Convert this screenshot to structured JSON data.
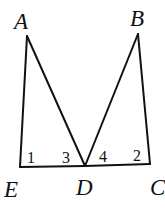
{
  "diagram": {
    "points": {
      "A": {
        "label": "A",
        "x": 27,
        "y": 36,
        "lx": 14,
        "ly": 29
      },
      "B": {
        "label": "B",
        "x": 138,
        "y": 34,
        "lx": 130,
        "ly": 26
      },
      "C": {
        "label": "C",
        "x": 150,
        "y": 164,
        "lx": 150,
        "ly": 195
      },
      "D": {
        "label": "D",
        "x": 85,
        "y": 166,
        "lx": 76,
        "ly": 195
      },
      "E": {
        "label": "E",
        "x": 20,
        "y": 167,
        "lx": 4,
        "ly": 197
      }
    },
    "segments": [
      [
        "A",
        "E"
      ],
      [
        "A",
        "D"
      ],
      [
        "E",
        "D"
      ],
      [
        "D",
        "C"
      ],
      [
        "B",
        "D"
      ],
      [
        "B",
        "C"
      ]
    ],
    "angles": [
      {
        "label": "1",
        "x": 27,
        "y": 163
      },
      {
        "label": "3",
        "x": 62,
        "y": 163
      },
      {
        "label": "4",
        "x": 99,
        "y": 162
      },
      {
        "label": "2",
        "x": 133,
        "y": 161
      }
    ]
  }
}
